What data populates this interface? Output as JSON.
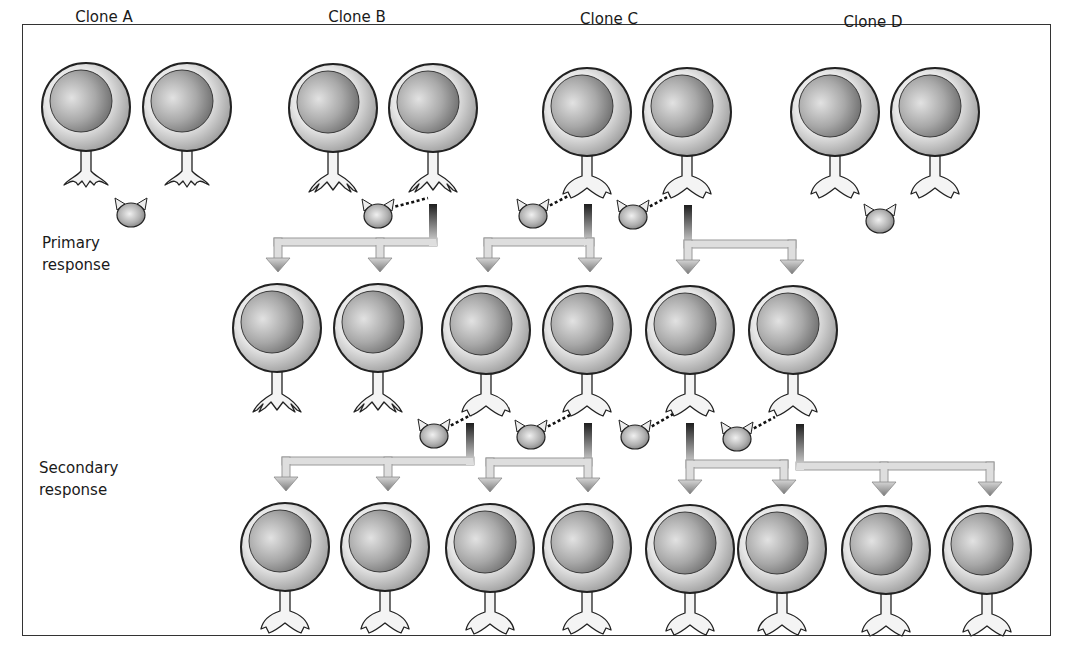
{
  "figure": {
    "clones": [
      {
        "label": "Clone A",
        "x": 104
      },
      {
        "label": "Clone B",
        "x": 357
      },
      {
        "label": "Clone C",
        "x": 609
      },
      {
        "label": "Clone D",
        "x": 873
      }
    ],
    "row_labels": {
      "primary_line1": "Primary",
      "primary_line2": "response",
      "secondary_line1": "Secondary",
      "secondary_line2": "response"
    },
    "colors": {
      "outline": "#222222",
      "cell_light": "#f4f4f4",
      "cell_mid": "#bdbdbd",
      "nucleus_light": "#d9d9d9",
      "nucleus_dark": "#6a6a6a",
      "arrow_fill": "#dedede",
      "arrow_dark": "#1e1e1e",
      "frame": "#333333"
    },
    "cells": [
      {
        "row": "naive",
        "clone": "A",
        "cx": 86,
        "cy": 107,
        "receptor": "A",
        "bound": false
      },
      {
        "row": "naive",
        "clone": "A",
        "cx": 187,
        "cy": 107,
        "receptor": "A",
        "bound": false
      },
      {
        "row": "naive",
        "clone": "B",
        "cx": 333,
        "cy": 108,
        "receptor": "B",
        "bound": false
      },
      {
        "row": "naive",
        "clone": "B",
        "cx": 433,
        "cy": 108,
        "receptor": "B",
        "bound": true
      },
      {
        "row": "naive",
        "clone": "C",
        "cx": 587,
        "cy": 112,
        "receptor": "C",
        "bound": true
      },
      {
        "row": "naive",
        "clone": "C",
        "cx": 687,
        "cy": 112,
        "receptor": "C",
        "bound": true
      },
      {
        "row": "naive",
        "clone": "D",
        "cx": 835,
        "cy": 112,
        "receptor": "C",
        "bound": false
      },
      {
        "row": "naive",
        "clone": "D",
        "cx": 935,
        "cy": 112,
        "receptor": "C",
        "bound": false
      },
      {
        "row": "primary",
        "clone": "B",
        "cx": 277,
        "cy": 328,
        "receptor": "B",
        "bound": false
      },
      {
        "row": "primary",
        "clone": "B",
        "cx": 378,
        "cy": 328,
        "receptor": "B",
        "bound": false
      },
      {
        "row": "primary",
        "clone": "C",
        "cx": 486,
        "cy": 330,
        "receptor": "C",
        "bound": true
      },
      {
        "row": "primary",
        "clone": "C",
        "cx": 587,
        "cy": 330,
        "receptor": "C",
        "bound": true
      },
      {
        "row": "primary",
        "clone": "C",
        "cx": 690,
        "cy": 330,
        "receptor": "C",
        "bound": true
      },
      {
        "row": "primary",
        "clone": "C",
        "cx": 793,
        "cy": 330,
        "receptor": "C",
        "bound": true
      },
      {
        "row": "secondary",
        "clone": "C",
        "cx": 285,
        "cy": 547,
        "receptor": "C",
        "bound": false
      },
      {
        "row": "secondary",
        "clone": "C",
        "cx": 385,
        "cy": 547,
        "receptor": "C",
        "bound": false
      },
      {
        "row": "secondary",
        "clone": "C",
        "cx": 490,
        "cy": 548,
        "receptor": "C",
        "bound": false
      },
      {
        "row": "secondary",
        "clone": "C",
        "cx": 587,
        "cy": 548,
        "receptor": "C",
        "bound": false
      },
      {
        "row": "secondary",
        "clone": "C",
        "cx": 690,
        "cy": 549,
        "receptor": "C",
        "bound": false
      },
      {
        "row": "secondary",
        "clone": "C",
        "cx": 782,
        "cy": 549,
        "receptor": "C",
        "bound": false
      },
      {
        "row": "secondary",
        "clone": "C",
        "cx": 886,
        "cy": 550,
        "receptor": "C",
        "bound": false
      },
      {
        "row": "secondary",
        "clone": "C",
        "cx": 987,
        "cy": 550,
        "receptor": "C",
        "bound": false
      }
    ],
    "antigens": [
      {
        "cx": 131,
        "cy": 215
      },
      {
        "cx": 378,
        "cy": 216,
        "link_to": [
          428,
          198
        ]
      },
      {
        "cx": 533,
        "cy": 216,
        "link_to": [
          572,
          194
        ]
      },
      {
        "cx": 633,
        "cy": 217,
        "link_to": [
          673,
          194
        ]
      },
      {
        "cx": 880,
        "cy": 221
      },
      {
        "cx": 434,
        "cy": 436,
        "link_to": [
          471,
          415
        ]
      },
      {
        "cx": 531,
        "cy": 437,
        "link_to": [
          570,
          415
        ]
      },
      {
        "cx": 635,
        "cy": 437,
        "link_to": [
          673,
          414
        ]
      },
      {
        "cx": 737,
        "cy": 439,
        "link_to": [
          775,
          417
        ]
      }
    ],
    "arrows": [
      {
        "stem_x": 433,
        "stem_top": 204,
        "bar_y": 242,
        "targets": [
          278,
          380
        ]
      },
      {
        "stem_x": 588,
        "stem_top": 204,
        "bar_y": 242,
        "targets": [
          488,
          590
        ]
      },
      {
        "stem_x": 688,
        "stem_top": 205,
        "bar_y": 244,
        "targets": [
          688,
          792
        ]
      },
      {
        "stem_x": 470,
        "stem_top": 423,
        "bar_y": 461,
        "targets": [
          286,
          388
        ]
      },
      {
        "stem_x": 588,
        "stem_top": 423,
        "bar_y": 462,
        "targets": [
          490,
          588
        ]
      },
      {
        "stem_x": 690,
        "stem_top": 423,
        "bar_y": 464,
        "targets": [
          690,
          784
        ]
      },
      {
        "stem_x": 800,
        "stem_top": 424,
        "bar_y": 466,
        "targets": [
          884,
          990
        ]
      }
    ]
  }
}
